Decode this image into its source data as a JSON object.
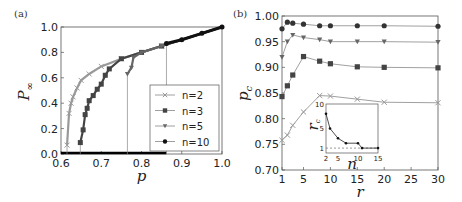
{
  "chart_data": [
    {
      "panel": "(a)",
      "type": "line",
      "xlabel": "p",
      "ylabel": "P∞",
      "xlim": [
        0.6,
        1.0
      ],
      "ylim": [
        0.0,
        1.0
      ],
      "xticks": [
        "0.6",
        "0.7",
        "0.8",
        "0.9",
        "1.0"
      ],
      "yticks": [
        "0.0",
        "0.2",
        "0.4",
        "0.6",
        "0.8",
        "1.0"
      ],
      "legend": [
        "n=2",
        "n=3",
        "n=5",
        "n=10"
      ],
      "legend_position": "lower right",
      "series": [
        {
          "name": "n=2",
          "marker": "x",
          "color": "#999999",
          "pc": 0.615,
          "x": [
            0.615,
            0.62,
            0.625,
            0.63,
            0.64,
            0.65,
            0.67,
            0.7,
            0.75,
            0.8,
            0.85,
            0.9,
            0.95,
            1.0
          ],
          "y": [
            0.07,
            0.32,
            0.4,
            0.45,
            0.52,
            0.58,
            0.63,
            0.69,
            0.75,
            0.8,
            0.85,
            0.9,
            0.95,
            1.0
          ]
        },
        {
          "name": "n=3",
          "marker": "square",
          "color": "#444444",
          "pc": 0.648,
          "x": [
            0.648,
            0.655,
            0.66,
            0.665,
            0.67,
            0.68,
            0.69,
            0.7,
            0.71,
            0.72,
            0.75,
            0.8,
            0.85,
            0.9,
            0.95,
            1.0
          ],
          "y": [
            0.09,
            0.19,
            0.31,
            0.36,
            0.42,
            0.46,
            0.51,
            0.55,
            0.62,
            0.67,
            0.75,
            0.8,
            0.85,
            0.9,
            0.95,
            1.0
          ]
        },
        {
          "name": "n=5",
          "marker": "triangle-down",
          "color": "#666666",
          "pc": 0.765,
          "x": [
            0.765,
            0.775,
            0.78,
            0.8,
            0.85,
            0.9,
            0.95,
            1.0
          ],
          "y": [
            0.63,
            0.68,
            0.76,
            0.8,
            0.85,
            0.9,
            0.95,
            1.0
          ]
        },
        {
          "name": "n=10",
          "marker": "circle",
          "color": "#111111",
          "pc": 0.862,
          "x": [
            0.862,
            0.9,
            0.95,
            1.0
          ],
          "y": [
            0.87,
            0.9,
            0.95,
            1.0
          ]
        }
      ]
    },
    {
      "panel": "(b)",
      "type": "line",
      "xlabel": "r",
      "ylabel": "pc",
      "xlim": [
        1,
        30
      ],
      "ylim": [
        0.7,
        1.0
      ],
      "xticks": [
        "1",
        "5",
        "10",
        "15",
        "20",
        "25",
        "30"
      ],
      "yticks": [
        "0.70",
        "0.75",
        "0.80",
        "0.85",
        "0.90",
        "0.95",
        "1.00"
      ],
      "series": [
        {
          "name": "n=10",
          "marker": "circle",
          "x": [
            1,
            2,
            3,
            5,
            8,
            10,
            15,
            20,
            30
          ],
          "y": [
            0.975,
            0.988,
            0.986,
            0.984,
            0.981,
            0.981,
            0.981,
            0.981,
            0.98
          ]
        },
        {
          "name": "n=5",
          "marker": "triangle-down",
          "x": [
            1,
            2,
            3,
            5,
            8,
            10,
            15,
            20,
            30
          ],
          "y": [
            0.92,
            0.95,
            0.963,
            0.958,
            0.954,
            0.95,
            0.95,
            0.95,
            0.949
          ]
        },
        {
          "name": "n=3",
          "marker": "square",
          "x": [
            1,
            2,
            3,
            5,
            8,
            10,
            15,
            20,
            30
          ],
          "y": [
            0.843,
            0.864,
            0.885,
            0.921,
            0.912,
            0.907,
            0.901,
            0.9,
            0.899
          ]
        },
        {
          "name": "n=2",
          "marker": "x",
          "x": [
            1,
            2,
            3,
            5,
            8,
            10,
            15,
            20,
            30
          ],
          "y": [
            0.758,
            0.768,
            0.787,
            0.813,
            0.845,
            0.844,
            0.838,
            0.832,
            0.831
          ]
        }
      ],
      "inset": {
        "xlabel": "n",
        "ylabel": "rc",
        "xlim": [
          2,
          15
        ],
        "ylim": [
          0,
          10
        ],
        "xticks": [
          "2",
          "5",
          "10",
          "15"
        ],
        "yticks": [
          "1",
          "5",
          "10"
        ],
        "reference_line": {
          "y": 1,
          "style": "dashed"
        },
        "x": [
          2,
          3,
          5,
          7,
          10,
          11,
          15
        ],
        "y": [
          8,
          5,
          3,
          2,
          2,
          1,
          1
        ]
      }
    }
  ],
  "labels": {
    "panel_a": "(a)",
    "panel_b": "(b)",
    "a_xlabel": "p",
    "a_ylabel": "P",
    "a_ylabel_sub": "∞",
    "b_xlabel": "r",
    "b_ylabel": "p",
    "b_ylabel_sub": "c",
    "inset_xlabel": "n",
    "inset_ylabel": "r",
    "inset_ylabel_sub": "c",
    "legend": [
      "n=2",
      "n=3",
      "n=5",
      "n=10"
    ]
  }
}
